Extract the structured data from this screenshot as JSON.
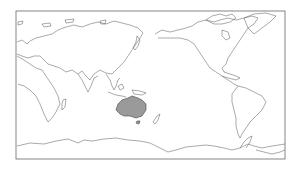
{
  "map": {
    "projection": "equirectangular",
    "center_longitude": 150,
    "frame": {
      "x": 16,
      "y": 11,
      "width": 269,
      "height": 148
    },
    "highlighted_region": {
      "name": "Australia",
      "fill": "#9a9a9a"
    },
    "coastline_color": "#555555",
    "background": "#ffffff"
  }
}
